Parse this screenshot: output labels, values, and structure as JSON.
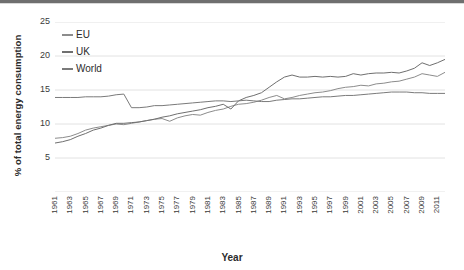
{
  "chart_data": {
    "type": "line",
    "title": "",
    "xlabel": "Year",
    "ylabel": "% of total energy consumption",
    "ylim": [
      0,
      25
    ],
    "yticks": [
      0,
      5,
      10,
      15,
      20,
      25
    ],
    "xlim": [
      1961,
      2012
    ],
    "grid": true,
    "legend_position": "top-left",
    "x": [
      1961,
      1962,
      1963,
      1964,
      1965,
      1966,
      1967,
      1968,
      1969,
      1970,
      1971,
      1972,
      1973,
      1974,
      1975,
      1976,
      1977,
      1978,
      1979,
      1980,
      1981,
      1982,
      1983,
      1984,
      1985,
      1986,
      1987,
      1988,
      1989,
      1990,
      1991,
      1992,
      1993,
      1994,
      1995,
      1996,
      1997,
      1998,
      1999,
      2000,
      2001,
      2002,
      2003,
      2004,
      2005,
      2006,
      2007,
      2008,
      2009,
      2010,
      2011,
      2012
    ],
    "xtick_labels": [
      "1961",
      "1963",
      "1965",
      "1967",
      "1969",
      "1971",
      "1973",
      "1975",
      "1977",
      "1979",
      "1981",
      "1983",
      "1985",
      "1987",
      "1989",
      "1991",
      "1993",
      "1995",
      "1997",
      "1999",
      "2001",
      "2003",
      "2005",
      "2007",
      "2009",
      "2011"
    ],
    "series": [
      {
        "name": "EU",
        "color": "#8c8c8c",
        "values": [
          7.9,
          8.0,
          8.2,
          8.6,
          9.1,
          9.4,
          9.6,
          9.8,
          10.0,
          9.9,
          10.1,
          10.3,
          10.5,
          10.7,
          10.8,
          10.4,
          10.9,
          11.2,
          11.4,
          11.3,
          11.7,
          12.0,
          12.2,
          12.6,
          12.9,
          13.0,
          13.2,
          13.5,
          13.9,
          14.2,
          13.7,
          13.9,
          14.2,
          14.4,
          14.6,
          14.7,
          14.9,
          15.2,
          15.4,
          15.5,
          15.7,
          15.6,
          15.9,
          16.0,
          16.2,
          16.3,
          16.6,
          16.9,
          17.4,
          17.2,
          17.0,
          17.6
        ]
      },
      {
        "name": "UK",
        "color": "#6f6f6f",
        "values": [
          7.2,
          7.4,
          7.7,
          8.2,
          8.6,
          9.1,
          9.4,
          9.8,
          10.1,
          10.1,
          10.2,
          10.3,
          10.5,
          10.7,
          11.0,
          11.2,
          11.5,
          11.7,
          11.9,
          12.1,
          12.4,
          12.6,
          12.9,
          12.2,
          13.4,
          13.9,
          14.2,
          14.6,
          15.4,
          16.2,
          16.9,
          17.2,
          16.9,
          16.9,
          17.0,
          16.9,
          17.0,
          16.9,
          17.0,
          17.4,
          17.2,
          17.4,
          17.5,
          17.5,
          17.6,
          17.5,
          17.8,
          18.2,
          19.0,
          18.6,
          19.0,
          19.5
        ]
      },
      {
        "name": "World",
        "color": "#7a7a7a",
        "values": [
          13.9,
          13.9,
          13.9,
          13.9,
          14.0,
          14.0,
          14.0,
          14.1,
          14.3,
          14.4,
          12.4,
          12.4,
          12.5,
          12.7,
          12.7,
          12.8,
          12.9,
          13.0,
          13.1,
          13.2,
          13.3,
          13.4,
          13.4,
          13.3,
          13.4,
          13.5,
          13.4,
          13.3,
          13.3,
          13.5,
          13.6,
          13.7,
          13.7,
          13.8,
          13.9,
          14.0,
          14.0,
          14.1,
          14.2,
          14.2,
          14.3,
          14.4,
          14.5,
          14.6,
          14.7,
          14.7,
          14.7,
          14.6,
          14.6,
          14.5,
          14.5,
          14.5
        ]
      }
    ]
  },
  "legend": {
    "items": [
      {
        "label": "EU"
      },
      {
        "label": "UK"
      },
      {
        "label": "World"
      }
    ]
  },
  "axes": {
    "y_title": "% of total energy consumption",
    "x_title": "Year"
  },
  "colors": {
    "grid": "#e2e2e2",
    "text": "#2b2b2b",
    "background": "#ffffff"
  }
}
